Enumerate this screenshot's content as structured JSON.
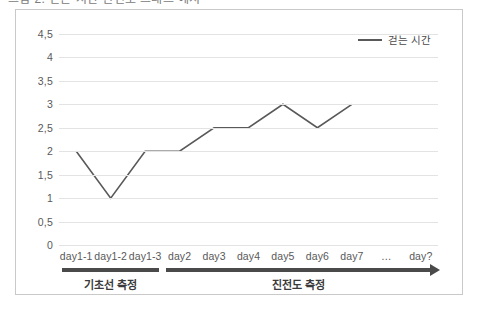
{
  "top_cutoff_text": "그림 2. 걷는 시간 진전도 그래프 예시",
  "legend": {
    "entries": [
      {
        "label": "걷는 시간",
        "color": "#595959",
        "icon": "line-swatch"
      }
    ]
  },
  "axes": {
    "y_ticks": [
      "4,5",
      "4",
      "3,5",
      "3",
      "2,5",
      "2",
      "1,5",
      "1",
      "0,5",
      "0"
    ],
    "x_ticks": [
      "day1-1",
      "day1-2",
      "day1-3",
      "day2",
      "day3",
      "day4",
      "day5",
      "day6",
      "day7",
      "…",
      "day?"
    ]
  },
  "phases": [
    {
      "label": "기초선 측정",
      "arrow": false
    },
    {
      "label": "진전도 측정",
      "arrow": true
    }
  ],
  "chart_data": {
    "type": "line",
    "title": "",
    "subtitle": "",
    "xlabel": "",
    "ylabel": "",
    "categories": [
      "day1-1",
      "day1-2",
      "day1-3",
      "day2",
      "day3",
      "day4",
      "day5",
      "day6",
      "day7",
      "…",
      "day?"
    ],
    "series": [
      {
        "name": "걷는 시간",
        "color": "#595959",
        "values": [
          2,
          1,
          2,
          2,
          2.5,
          2.5,
          3,
          2.5,
          3,
          null,
          null
        ]
      }
    ],
    "ylim": [
      0,
      4.5
    ],
    "ytick_step": 0.5,
    "grid": true,
    "grid_axis": "y",
    "grid_color": "#e3e3e3",
    "legend_position": "top-right",
    "markers": false,
    "annotations": [
      {
        "text": "기초선 측정",
        "spans": [
          "day1-1",
          "day1-3"
        ],
        "style": "underline-bar"
      },
      {
        "text": "진전도 측정",
        "spans": [
          "day2",
          "day?"
        ],
        "style": "underline-bar-arrow"
      }
    ]
  }
}
